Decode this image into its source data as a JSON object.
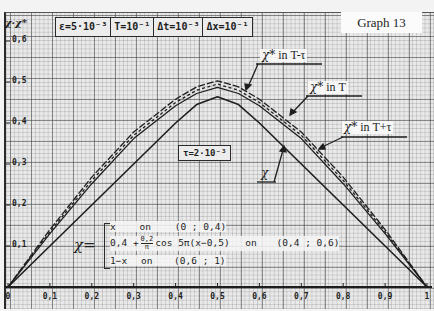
{
  "graph_label": "Graph 13",
  "axis": {
    "y_label": "χ·χ*"
  },
  "params": [
    {
      "text": "ε=5·10⁻³"
    },
    {
      "text": "T=10⁻¹"
    },
    {
      "text": "Δt=10⁻³"
    },
    {
      "text": "Δx=10⁻¹"
    }
  ],
  "tau_box": "τ=2·10⁻³",
  "annotations": {
    "t_minus_tau": {
      "symbol": "χ*",
      "text": " in T-τ"
    },
    "t": {
      "symbol": "χ*",
      "text": " in T"
    },
    "t_plus_tau": {
      "symbol": "χ*",
      "text": " in T+τ"
    },
    "chi": {
      "symbol": "χ"
    }
  },
  "formula": {
    "lhs": "χ=",
    "rows": [
      {
        "expr": "x",
        "on": "on",
        "interval": "(0 ; 0,4)"
      },
      {
        "expr_a": "0,4 +",
        "frac_num": "0,2",
        "frac_den": "π",
        "expr_b": "cos 5π(x−0,5)",
        "on": "on",
        "interval": "(0,4 ; 0,6)"
      },
      {
        "expr": "1−x",
        "on": "on",
        "interval": "(0,6 ; 1)"
      }
    ]
  },
  "chart_data": {
    "type": "line",
    "title": "Graph 13",
    "xlabel": "x",
    "ylabel": "χ·χ*",
    "xlim": [
      0,
      1
    ],
    "ylim": [
      0,
      0.6
    ],
    "grid": true,
    "x_ticks": [
      "0",
      "0,1",
      "0,2",
      "0,3",
      "0,4",
      "0,5",
      "0,6",
      "0,7",
      "0,8",
      "0,9",
      "1"
    ],
    "y_ticks": [
      "0,1",
      "0,2",
      "0,3",
      "0,4",
      "0,5",
      "0,6"
    ],
    "x": [
      0,
      0.1,
      0.2,
      0.3,
      0.4,
      0.45,
      0.5,
      0.55,
      0.6,
      0.7,
      0.8,
      0.9,
      1
    ],
    "series": [
      {
        "name": "χ* in T-τ",
        "style": "long-dash",
        "values": [
          0,
          0.14,
          0.268,
          0.378,
          0.458,
          0.488,
          0.503,
          0.488,
          0.458,
          0.378,
          0.268,
          0.14,
          0
        ]
      },
      {
        "name": "χ* in T",
        "style": "dashed",
        "values": [
          0,
          0.135,
          0.26,
          0.37,
          0.45,
          0.48,
          0.495,
          0.48,
          0.45,
          0.37,
          0.26,
          0.135,
          0
        ]
      },
      {
        "name": "χ* in T+τ",
        "style": "solid",
        "values": [
          0,
          0.13,
          0.252,
          0.362,
          0.442,
          0.472,
          0.487,
          0.472,
          0.442,
          0.362,
          0.252,
          0.13,
          0
        ]
      },
      {
        "name": "χ",
        "style": "solid",
        "values": [
          0,
          0.1,
          0.2,
          0.3,
          0.4,
          0.445,
          0.464,
          0.445,
          0.4,
          0.3,
          0.2,
          0.1,
          0
        ]
      }
    ],
    "annotations": [
      "ε=5·10⁻³",
      "T=10⁻¹",
      "Δt=10⁻³",
      "Δx=10⁻¹",
      "τ=2·10⁻³"
    ]
  }
}
